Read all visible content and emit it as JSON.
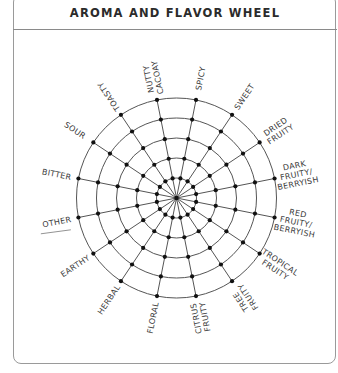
{
  "title": "AROMA AND FLAVOR WHEEL",
  "wheel": {
    "center": [
      176.5,
      198
    ],
    "ring_radii": [
      20,
      40,
      60,
      80,
      100
    ],
    "spoke_count": 16,
    "spoke_offset_deg": 11.25,
    "line_color": "#555555",
    "dot_color": "#111111"
  },
  "labels": [
    {
      "text": [
        "NUTTY",
        "CACOAY"
      ],
      "angle": -11.25
    },
    {
      "text": [
        "SPICY"
      ],
      "angle": 11.25
    },
    {
      "text": [
        "SWEET"
      ],
      "angle": 33.75
    },
    {
      "text": [
        "DRIED",
        "FRUITY"
      ],
      "angle": 56.25
    },
    {
      "text": [
        "DARK",
        "FRUITY/",
        "BERRYISH"
      ],
      "angle": 78.75
    },
    {
      "text": [
        "RED",
        "FRUITY/",
        "BERRYISH"
      ],
      "angle": 101.25
    },
    {
      "text": [
        "TROPICAL",
        "FRUITY"
      ],
      "angle": 123.75
    },
    {
      "text": [
        "TREE",
        "FRUITY"
      ],
      "angle": 146.25
    },
    {
      "text": [
        "CITRUS",
        "FRUITY"
      ],
      "angle": 168.75
    },
    {
      "text": [
        "FLORAL"
      ],
      "angle": 191.25
    },
    {
      "text": [
        "HERBAL"
      ],
      "angle": 213.75
    },
    {
      "text": [
        "EARTHY"
      ],
      "angle": 236.25
    },
    {
      "text": [
        "OTHER"
      ],
      "angle": 258.75,
      "blank_line": true
    },
    {
      "text": [
        "BITTER"
      ],
      "angle": 281.25
    },
    {
      "text": [
        "SOUR"
      ],
      "angle": 303.75
    },
    {
      "text": [
        "TOASTY"
      ],
      "angle": 326.25
    }
  ]
}
